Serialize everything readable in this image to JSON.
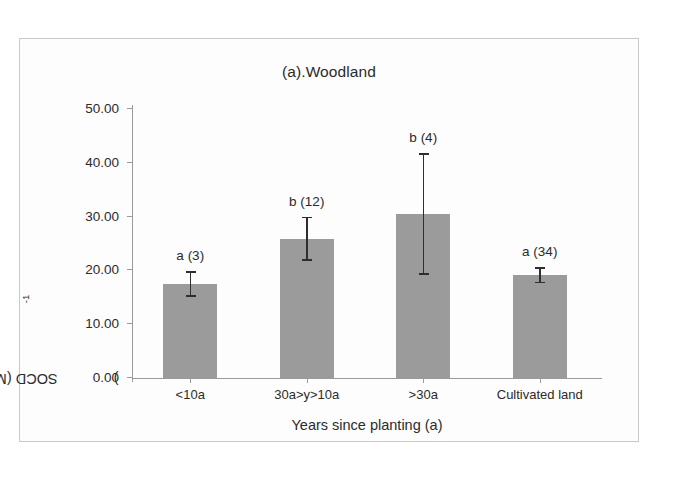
{
  "figure": {
    "panel_title": "(a).Woodland"
  },
  "chart_data": {
    "type": "bar",
    "title": "(a).Woodland",
    "xlabel": "Years since planting (a)",
    "ylabel": "SOCD (Mg ha-1)",
    "ylabel_base": "SOCD (Mg ha",
    "ylabel_exponent": "-1",
    "ylabel_close": ")",
    "categories": [
      "<10a",
      "30a>y>10a",
      ">30a",
      "Cultivated land"
    ],
    "values": [
      17.5,
      25.9,
      30.5,
      19.1
    ],
    "errors": [
      2.4,
      4.1,
      11.3,
      1.5
    ],
    "error_upper": [
      19.9,
      30.0,
      41.8,
      20.6
    ],
    "error_lower": [
      15.1,
      21.8,
      19.2,
      17.6
    ],
    "point_labels": [
      "a (3)",
      "b (12)",
      "b (4)",
      "a (34)"
    ],
    "sample_sizes": [
      3,
      12,
      4,
      34
    ],
    "significance_groups": [
      "a",
      "b",
      "b",
      "a"
    ],
    "ylim": [
      0,
      50
    ],
    "ytick_values": [
      0,
      10,
      20,
      30,
      40,
      50
    ],
    "ytick_labels": [
      "0.00",
      "10.00",
      "20.00",
      "30.00",
      "40.00",
      "50.00"
    ],
    "grid": false,
    "legend": false,
    "bar_color": "#9b9b9b",
    "errorbar_color": "#2e2e2e",
    "axis_color": "#9a9a9a"
  }
}
